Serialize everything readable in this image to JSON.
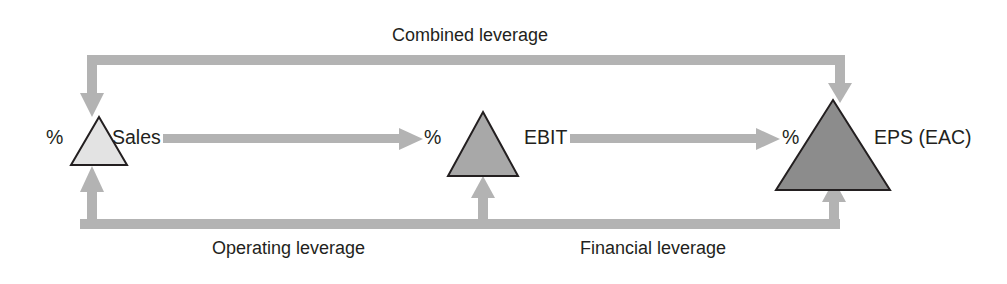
{
  "diagram": {
    "background_color": "#ffffff",
    "connector_color": "#b3b3b3",
    "text_color": "#231f20",
    "outline_color": "#231f20",
    "nodes": [
      {
        "id": "sales",
        "label": "Sales",
        "percent_symbol": "%",
        "fill_color": "#e3e3e3",
        "size": "small"
      },
      {
        "id": "ebit",
        "label": "EBIT",
        "percent_symbol": "%",
        "fill_color": "#a8a8a8",
        "size": "medium"
      },
      {
        "id": "eps",
        "label": "EPS (EAC)",
        "percent_symbol": "%",
        "fill_color": "#8c8c8c",
        "size": "large"
      }
    ],
    "connectors": [
      {
        "id": "combined-leverage",
        "label": "Combined leverage",
        "from": "sales",
        "to": "eps",
        "position": "top",
        "arrowheads": "both"
      },
      {
        "id": "operating-leverage",
        "label": "Operating leverage",
        "from": "sales",
        "to": "ebit",
        "position": "bottom",
        "arrowheads": "both"
      },
      {
        "id": "financial-leverage",
        "label": "Financial leverage",
        "from": "ebit",
        "to": "eps",
        "position": "bottom",
        "arrowheads": "both"
      },
      {
        "id": "sales-to-ebit",
        "label": "",
        "from": "sales",
        "to": "ebit",
        "position": "middle",
        "arrowheads": "end"
      },
      {
        "id": "ebit-to-eps",
        "label": "",
        "from": "ebit",
        "to": "eps",
        "position": "middle",
        "arrowheads": "end"
      }
    ]
  }
}
